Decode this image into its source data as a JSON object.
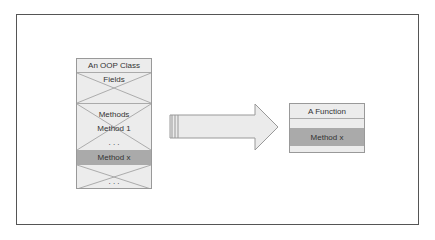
{
  "diagram": {
    "class_box": {
      "title": "An OOP Class",
      "fields_label": "Fields",
      "methods_label": "Methods",
      "method_1": "Method 1",
      "ellipsis_1": ". . .",
      "method_x": "Method x",
      "ellipsis_2": ". . ."
    },
    "function_box": {
      "title": "A Function",
      "method_x": "Method x"
    },
    "colors": {
      "box_fill": "#ececec",
      "highlight_fill": "#aaaaaa",
      "border": "#999999",
      "frame": "#555555"
    }
  }
}
